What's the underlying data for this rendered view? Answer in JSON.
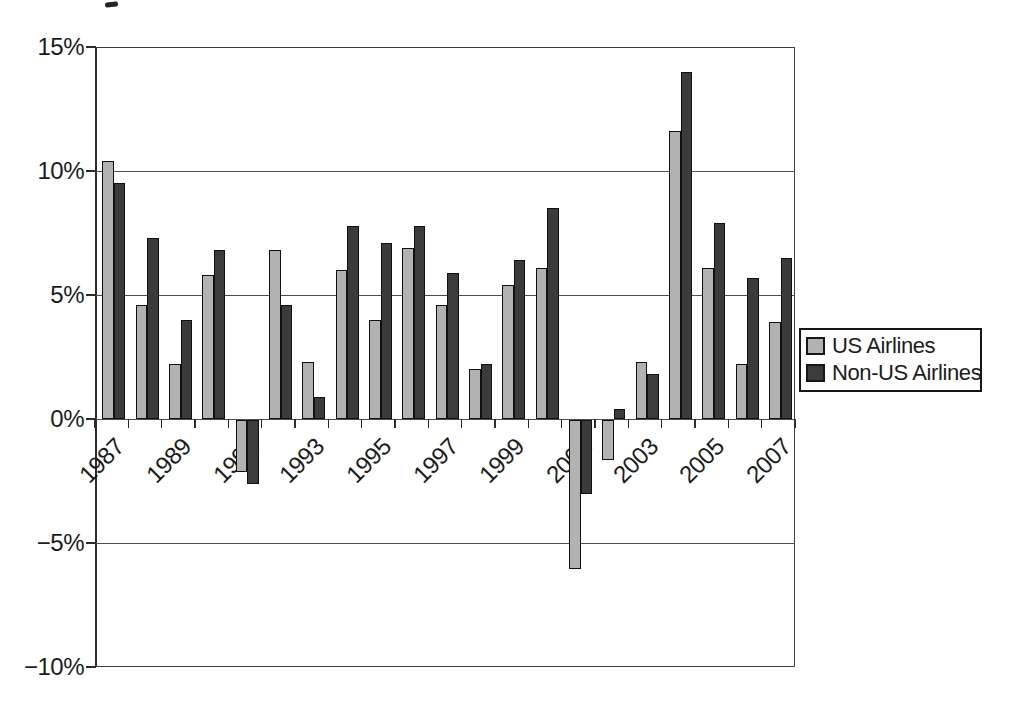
{
  "chart_data": {
    "type": "bar",
    "title": "",
    "xlabel": "",
    "ylabel": "",
    "categories": [
      "1987",
      "1988",
      "1989",
      "1990",
      "1991",
      "1992",
      "1993",
      "1994",
      "1995",
      "1996",
      "1997",
      "1998",
      "1999",
      "2000",
      "2001",
      "2002",
      "2003",
      "2004",
      "2005",
      "2006",
      "2007"
    ],
    "series": [
      {
        "name": "US Airlines",
        "color": "#b2b2b2",
        "values": [
          10.4,
          4.6,
          2.2,
          5.8,
          -2.1,
          6.8,
          2.3,
          6.0,
          4.0,
          6.9,
          4.6,
          2.0,
          5.4,
          6.1,
          -6.0,
          -1.6,
          2.3,
          11.6,
          6.1,
          2.2,
          3.9
        ]
      },
      {
        "name": "Non-US Airlines",
        "color": "#3b3b3b",
        "values": [
          9.5,
          7.3,
          4.0,
          6.8,
          -2.6,
          4.6,
          0.9,
          7.8,
          7.1,
          7.8,
          5.9,
          2.2,
          6.4,
          8.5,
          -3.0,
          0.4,
          1.8,
          14.0,
          7.9,
          5.7,
          6.5
        ]
      }
    ],
    "ylim": [
      -10,
      15
    ],
    "y_ticks": [
      {
        "value": 15,
        "label": "15%"
      },
      {
        "value": 10,
        "label": "10%"
      },
      {
        "value": 5,
        "label": "5%"
      },
      {
        "value": 0,
        "label": "0%"
      },
      {
        "value": -5,
        "label": "−5%"
      },
      {
        "value": -10,
        "label": "−10%"
      }
    ],
    "x_tick_labels": [
      "1987",
      "1989",
      "1991",
      "1993",
      "1995",
      "1997",
      "1999",
      "2001",
      "2003",
      "2005",
      "2007"
    ],
    "grid": true,
    "legend_position": "right"
  }
}
